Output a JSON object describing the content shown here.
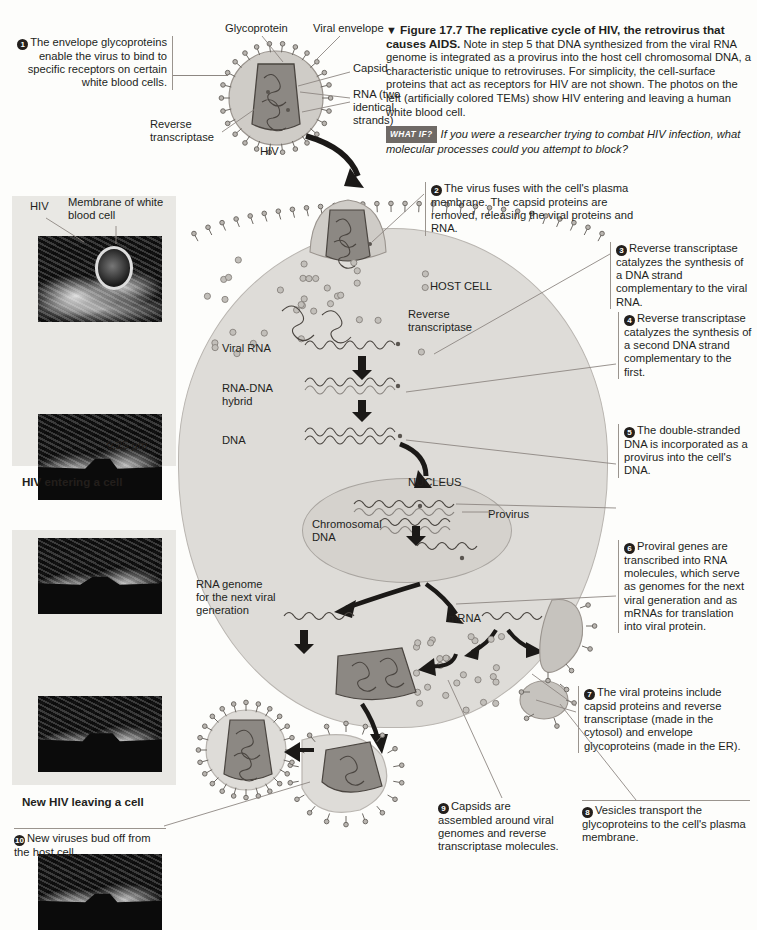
{
  "figure": {
    "marker": "▼",
    "number": "Figure 17.7",
    "title": "The replicative cycle of HIV, the retrovirus that causes AIDS.",
    "body": "Note in step 5 that DNA synthesized from the viral RNA genome is integrated as a provirus into the host cell chromosomal DNA, a characteristic unique to retroviruses. For simplicity, the cell-surface proteins that act as receptors for HIV are not shown. The photos on the left (artificially colored TEMs) show HIV entering and leaving a human white blood cell.",
    "whatif_badge": "WHAT IF?",
    "whatif_text": "If you were a researcher trying to combat HIV infection, what molecular processes could you attempt to block?"
  },
  "virus_labels": {
    "glycoprotein": "Glycoprotein",
    "viral_envelope": "Viral envelope",
    "capsid": "Capsid",
    "rna": "RNA (two identical strands)",
    "reverse_transcriptase": "Reverse transcriptase",
    "hiv": "HIV"
  },
  "micrographs": {
    "top": {
      "label_hiv": "HIV",
      "label_membrane": "Membrane of white blood cell",
      "scale": "0.25 µm",
      "caption": "HIV entering a cell"
    },
    "bottom": {
      "caption": "New HIV leaving a cell"
    }
  },
  "cell_labels": {
    "host_cell": "HOST CELL",
    "reverse_transcriptase": "Reverse transcriptase",
    "viral_rna": "Viral RNA",
    "rna_dna_hybrid": "RNA-DNA hybrid",
    "dna": "DNA",
    "nucleus": "NUCLEUS",
    "chromosomal_dna": "Chromosomal DNA",
    "provirus": "Provirus",
    "rna_genome": "RNA genome for the next viral generation",
    "mrna": "mRNA"
  },
  "steps": [
    {
      "n": "1",
      "text": "The envelope glycoproteins enable the virus to bind to specific receptors on certain white blood cells."
    },
    {
      "n": "2",
      "text": "The virus fuses with the cell's plasma membrane. The capsid proteins are removed, releasing the viral proteins and RNA."
    },
    {
      "n": "3",
      "text": "Reverse transcriptase catalyzes the synthesis of a DNA strand complementary to the viral RNA."
    },
    {
      "n": "4",
      "text": "Reverse transcriptase catalyzes the synthesis of a second DNA strand complementary to the first."
    },
    {
      "n": "5",
      "text": "The double-stranded DNA is incorporated as a provirus into the cell's DNA."
    },
    {
      "n": "6",
      "text": "Proviral genes are transcribed into RNA molecules, which serve as genomes for the next viral generation and as mRNAs for translation into viral protein."
    },
    {
      "n": "7",
      "text": "The viral proteins include capsid proteins and reverse transcriptase (made in the cytosol) and envelope glycoproteins (made in the ER)."
    },
    {
      "n": "8",
      "text": "Vesicles transport the glycoproteins to the cell's plasma membrane."
    },
    {
      "n": "9",
      "text": "Capsids are assembled around viral genomes and reverse transcriptase molecules."
    },
    {
      "n": "10",
      "text": "New viruses bud off from the host cell."
    }
  ],
  "colors": {
    "cell_fill": "#dedcd8",
    "nucleus_fill": "#d5d2cd",
    "capsid_fill": "#8c8883",
    "envelope_fill": "#cfccc7",
    "ink": "#231f1c",
    "leader": "#8d8782"
  }
}
